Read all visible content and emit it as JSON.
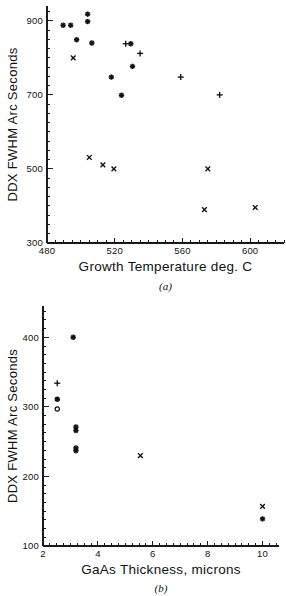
{
  "chart_data": [
    {
      "type": "scatter",
      "panel": "(a)",
      "title": "",
      "xlabel": "Growth Temperature deg. C",
      "ylabel": "DDX FWHM Arc Seconds",
      "xlim": [
        480,
        620
      ],
      "ylim": [
        300,
        940
      ],
      "xticks": [
        480,
        520,
        560,
        600
      ],
      "yticks": [
        300,
        500,
        700,
        900
      ],
      "xtick_labels": [
        "480",
        "520",
        "560",
        "600"
      ],
      "ytick_labels": [
        "300",
        "500",
        "700",
        "900"
      ],
      "x_minor_step": 5,
      "y_minor_step": 25,
      "grid": false,
      "legend": "none",
      "series": [
        {
          "name": "asterisk",
          "marker": "star",
          "points": [
            [
              489.5,
              888
            ],
            [
              494.0,
              888
            ],
            [
              497.5,
              849
            ],
            [
              504.0,
              918
            ],
            [
              504.0,
              898
            ],
            [
              506.5,
              840
            ],
            [
              518.0,
              748
            ],
            [
              524.0,
              699
            ],
            [
              529.5,
              838
            ],
            [
              530.5,
              777
            ]
          ]
        },
        {
          "name": "plus",
          "marker": "plus",
          "points": [
            [
              526.5,
              838
            ],
            [
              535.0,
              812
            ],
            [
              559.0,
              748
            ],
            [
              582.0,
              700
            ]
          ]
        },
        {
          "name": "cross",
          "marker": "cross",
          "points": [
            [
              495.5,
              800
            ],
            [
              505.0,
              531
            ],
            [
              513.0,
              511
            ],
            [
              519.5,
              500
            ],
            [
              575.0,
              500
            ],
            [
              573.0,
              390
            ],
            [
              603.0,
              396
            ]
          ]
        }
      ]
    },
    {
      "type": "scatter",
      "panel": "(b)",
      "title": "",
      "xlabel": "GaAs Thickness, microns",
      "ylabel": "DDX FWHM Arc Seconds",
      "xlim": [
        2,
        10.6
      ],
      "ylim": [
        100,
        445
      ],
      "xticks": [
        2,
        4,
        6,
        8,
        10
      ],
      "yticks": [
        100,
        200,
        300,
        400
      ],
      "xtick_labels": [
        "2",
        "4",
        "6",
        "8",
        "10"
      ],
      "ytick_labels": [
        "100",
        "200",
        "300",
        "400"
      ],
      "x_minor_step": 0.25,
      "y_minor_step": 12.5,
      "grid": false,
      "legend": "none",
      "series": [
        {
          "name": "asterisk",
          "marker": "star",
          "points": [
            [
              3.1,
              400
            ],
            [
              3.2,
              271
            ],
            [
              3.2,
              266
            ],
            [
              3.2,
              241
            ],
            [
              3.2,
              237
            ],
            [
              10.0,
              139
            ]
          ]
        },
        {
          "name": "plus",
          "marker": "plus",
          "points": [
            [
              2.52,
              334
            ]
          ]
        },
        {
          "name": "circle-filled",
          "marker": "circle-filled",
          "points": [
            [
              2.52,
              311
            ]
          ]
        },
        {
          "name": "circle-open",
          "marker": "circle-open",
          "points": [
            [
              2.52,
              297
            ]
          ]
        },
        {
          "name": "cross",
          "marker": "cross",
          "points": [
            [
              5.55,
              230
            ],
            [
              10.0,
              157
            ]
          ]
        }
      ]
    }
  ],
  "figures": {
    "a": {
      "panel_label": "(a)",
      "xlabel": "Growth Temperature deg. C",
      "ylabel": "DDX FWHM Arc Seconds"
    },
    "b": {
      "panel_label": "(b)",
      "xlabel": "GaAs Thickness, microns",
      "ylabel": "DDX FWHM Arc Seconds"
    }
  },
  "colors": {
    "ink": "#111111",
    "background": "#ffffff"
  }
}
